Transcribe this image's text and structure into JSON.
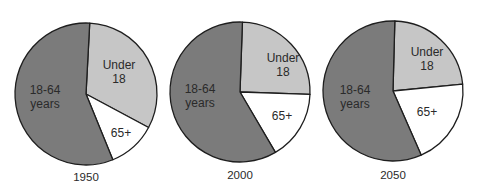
{
  "chart_data": [
    {
      "type": "pie",
      "title": "1950",
      "categories": [
        "Under 18",
        "65+",
        "18-64 years"
      ],
      "values": [
        32,
        11,
        57
      ],
      "colors": [
        "#c6c6c6",
        "#ffffff",
        "#7b7b7b"
      ],
      "start_angle_deg": 3,
      "labels": [
        [
          "Under",
          "18"
        ],
        [
          "65+"
        ],
        [
          "18-64",
          "years"
        ]
      ]
    },
    {
      "type": "pie",
      "title": "2000",
      "categories": [
        "Under 18",
        "65+",
        "18-64 years"
      ],
      "values": [
        25,
        16,
        59
      ],
      "colors": [
        "#c6c6c6",
        "#ffffff",
        "#7b7b7b"
      ],
      "start_angle_deg": 2,
      "labels": [
        [
          "Under",
          "18"
        ],
        [
          "65+"
        ],
        [
          "18-64",
          "years"
        ]
      ]
    },
    {
      "type": "pie",
      "title": "2050",
      "categories": [
        "Under 18",
        "65+",
        "18-64 years"
      ],
      "values": [
        23,
        20,
        57
      ],
      "colors": [
        "#c6c6c6",
        "#ffffff",
        "#7b7b7b"
      ],
      "start_angle_deg": 1.5,
      "labels": [
        [
          "Under",
          "18"
        ],
        [
          "65+"
        ],
        [
          "18-64",
          "years"
        ]
      ]
    }
  ],
  "pies": [
    {
      "year": "1950",
      "under18": {
        "line1": "Under",
        "line2": "18"
      },
      "age65": "65+",
      "adults": {
        "line1": "18-64",
        "line2": "years"
      }
    },
    {
      "year": "2000",
      "under18": {
        "line1": "Under",
        "line2": "18"
      },
      "age65": "65+",
      "adults": {
        "line1": "18-64",
        "line2": "years"
      }
    },
    {
      "year": "2050",
      "under18": {
        "line1": "Under",
        "line2": "18"
      },
      "age65": "65+",
      "adults": {
        "line1": "18-64",
        "line2": "years"
      }
    }
  ]
}
